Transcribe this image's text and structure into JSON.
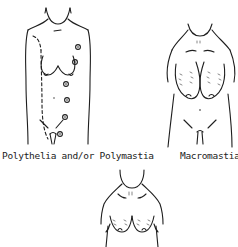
{
  "figures": [
    {
      "id": "polythelia",
      "caption": "Polythelia and/or Polymastia",
      "description": "Front torso outline with dashed milk line and supernumerary nipples along it"
    },
    {
      "id": "macromastia",
      "caption": "Macromastia",
      "description": "Front torso outline with enlarged pendulous breasts"
    },
    {
      "id": "third-condition",
      "caption": "",
      "description": "Upper torso outline with breasts (caption cropped out of view)"
    }
  ],
  "colors": {
    "ink": "#1e1e1e",
    "background": "#ffffff"
  }
}
